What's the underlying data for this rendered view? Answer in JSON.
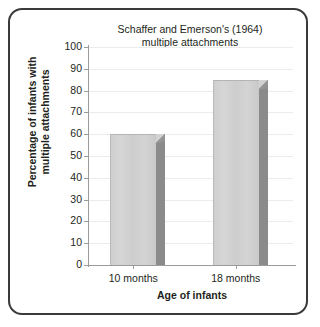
{
  "figure": {
    "border_color": "#3a3a3c",
    "background": "#ffffff"
  },
  "chart_data": {
    "type": "bar",
    "title": "Schaffer and Emerson's (1964)\nmultiple attachments",
    "categories": [
      "10 months",
      "18 months"
    ],
    "values": [
      60,
      85
    ],
    "xlabel": "Age of infants",
    "ylabel": "Percentage of infants with\nmultiple attachments",
    "ylim": [
      0,
      100
    ],
    "ytick_step": 10,
    "yticks": [
      100,
      90,
      80,
      70,
      60,
      50,
      40,
      30,
      20,
      10,
      0
    ],
    "ytick_labels": [
      "100",
      "90",
      "80",
      "70",
      "60",
      "50",
      "40",
      "30",
      "20",
      "10",
      "0"
    ],
    "grid": true,
    "legend": false,
    "style": "3d-bar",
    "colors": {
      "bar_front": "#d2d2d2",
      "bar_side": "#8b8b8b",
      "bar_top": "#b6b6b6",
      "axis": "#9b9b9b",
      "gridline": "#ececec",
      "text": "#231f20"
    }
  }
}
